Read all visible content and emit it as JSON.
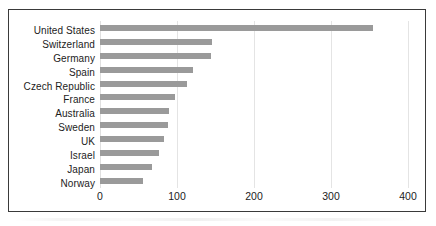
{
  "chart_data": {
    "type": "bar",
    "orientation": "horizontal",
    "title": "",
    "subtitle": "",
    "xlabel": "",
    "ylabel": "",
    "categories": [
      "United States",
      "Switzerland",
      "Germany",
      "Spain",
      "Czech Republic",
      "France",
      "Australia",
      "Sweden",
      "UK",
      "Israel",
      "Japan",
      "Norway"
    ],
    "values": [
      355,
      145,
      144,
      121,
      113,
      97,
      90,
      88,
      83,
      77,
      68,
      56
    ],
    "xlim": [
      0,
      400
    ],
    "xticks": [
      0,
      100,
      200,
      300,
      400
    ],
    "xtick_labels": [
      "0",
      "100",
      "200",
      "300",
      "400"
    ],
    "grid": true,
    "grid_axis": "x",
    "legend": false,
    "legend_position": "none",
    "bar_color": "#9a9a9a",
    "gridline_color": "#e4e4e4",
    "frame_color": "#3a3a3a",
    "text_color": "#1c1c1c"
  }
}
